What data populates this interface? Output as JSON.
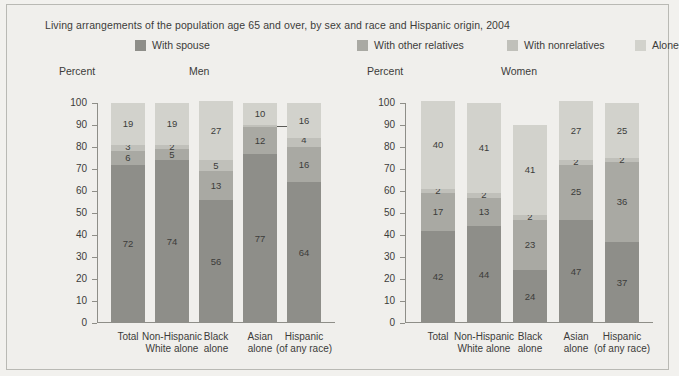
{
  "title": "Living arrangements of the population age 65 and over, by sex and race and Hispanic origin, 2004",
  "axis_label": "Percent",
  "panels": [
    {
      "key": "men",
      "label": "Men"
    },
    {
      "key": "women",
      "label": "Women"
    }
  ],
  "legend": [
    {
      "label": "With spouse",
      "color": "#8e8e89"
    },
    {
      "label": "With other relatives",
      "color": "#a9a9a3"
    },
    {
      "label": "With nonrelatives",
      "color": "#c0c0ba"
    },
    {
      "label": "Alone",
      "color": "#d2d2cc"
    }
  ],
  "chart_data": {
    "type": "bar",
    "title": "Living arrangements of the population age 65 and over, by sex and race and Hispanic origin, 2004",
    "subtype": "100% stacked column",
    "xlabel": "",
    "ylabel": "Percent",
    "ylim": [
      0,
      100
    ],
    "ytick_values": [
      0,
      10,
      20,
      30,
      40,
      50,
      60,
      70,
      80,
      90,
      100
    ],
    "grid": false,
    "legend_position": "top",
    "categories": [
      "Total",
      "Non-Hispanic White alone",
      "Black alone",
      "Asian alone",
      "Hispanic (of any race)"
    ],
    "category_lines": [
      [
        "Total",
        ""
      ],
      [
        "Non-Hispanic",
        "White alone"
      ],
      [
        "Black",
        "alone"
      ],
      [
        "Asian",
        "alone"
      ],
      [
        "Hispanic",
        "(of any race)"
      ]
    ],
    "panels": [
      {
        "name": "Men",
        "series": [
          {
            "name": "With spouse",
            "values": [
              72,
              74,
              56,
              77,
              64
            ]
          },
          {
            "name": "With other relatives",
            "values": [
              6,
              5,
              13,
              12,
              16
            ]
          },
          {
            "name": "With nonrelatives",
            "values": [
              3,
              2,
              5,
              1,
              4
            ]
          },
          {
            "name": "Alone",
            "values": [
              19,
              19,
              27,
              10,
              16
            ]
          }
        ]
      },
      {
        "name": "Women",
        "series": [
          {
            "name": "With spouse",
            "values": [
              42,
              44,
              24,
              47,
              37
            ]
          },
          {
            "name": "With other relatives",
            "values": [
              17,
              13,
              23,
              25,
              36
            ]
          },
          {
            "name": "With nonrelatives",
            "values": [
              2,
              2,
              2,
              2,
              2
            ]
          },
          {
            "name": "Alone",
            "values": [
              40,
              41,
              41,
              27,
              25
            ]
          }
        ]
      }
    ],
    "annotations": [
      {
        "panel": "Men",
        "category": "Asian alone",
        "series": "With nonrelatives",
        "text": "1",
        "style": "leader-line-right"
      }
    ]
  }
}
